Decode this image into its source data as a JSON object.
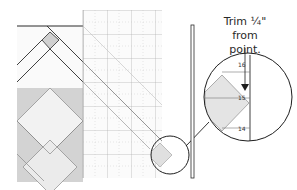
{
  "figure": {
    "caption_line1": "Trim ¼\"",
    "caption_line2": "from point.",
    "magnifier_labels": [
      "16",
      "15",
      "14"
    ],
    "colors": {
      "line": "#2b2b2b",
      "grid": "#9a9a9a",
      "fabric_dark": "#cfcfcf",
      "fabric_light": "#ececec",
      "fabric_mid": "#dedede",
      "ruler_bg": "#fbfbfb"
    }
  }
}
